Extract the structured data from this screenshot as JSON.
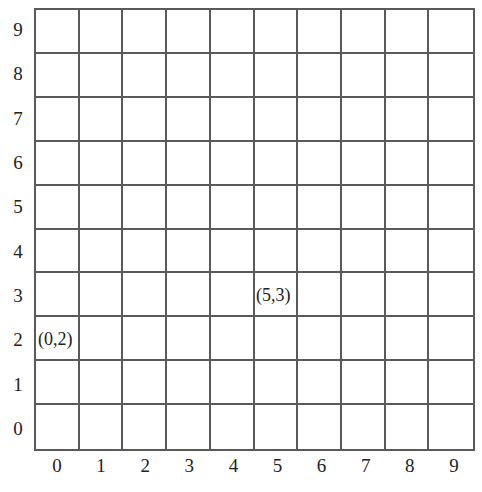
{
  "grid": {
    "columns": 10,
    "rows": 10,
    "line_color": "#5a5a5a",
    "x_axis_labels": [
      "0",
      "1",
      "2",
      "3",
      "4",
      "5",
      "6",
      "7",
      "8",
      "9"
    ],
    "y_axis_labels": [
      "9",
      "8",
      "7",
      "6",
      "5",
      "4",
      "3",
      "2",
      "1",
      "0"
    ]
  },
  "points": [
    {
      "label": "(0,2)",
      "x": 0,
      "y": 2
    },
    {
      "label": "(5,3)",
      "x": 5,
      "y": 3
    }
  ]
}
